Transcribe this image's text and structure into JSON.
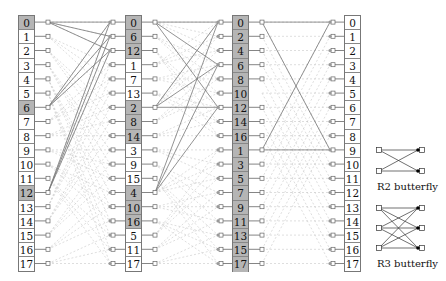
{
  "diagram": {
    "type": "mixed-radix FFT signal flow (N=18)",
    "columns": [
      {
        "id": "input",
        "values": [
          0,
          1,
          2,
          3,
          4,
          5,
          6,
          7,
          8,
          9,
          10,
          11,
          12,
          13,
          14,
          15,
          16,
          17
        ],
        "highlight_rows": [
          0,
          6,
          12
        ]
      },
      {
        "id": "stage1",
        "values": [
          0,
          6,
          12,
          1,
          7,
          13,
          2,
          8,
          14,
          3,
          9,
          15,
          4,
          10,
          16,
          5,
          11,
          17
        ],
        "highlight_rows": [
          0,
          1,
          2,
          6,
          7,
          8,
          12,
          13,
          14
        ]
      },
      {
        "id": "stage2",
        "values": [
          0,
          2,
          4,
          6,
          8,
          10,
          12,
          14,
          16,
          1,
          3,
          5,
          7,
          9,
          11,
          13,
          15,
          17
        ],
        "highlight_rows": [
          0,
          1,
          2,
          3,
          4,
          5,
          6,
          7,
          8,
          9,
          10,
          11,
          12,
          13,
          14,
          15,
          16,
          17
        ]
      },
      {
        "id": "output",
        "values": [
          0,
          1,
          2,
          3,
          4,
          5,
          6,
          7,
          8,
          9,
          10,
          11,
          12,
          13,
          14,
          15,
          16,
          17
        ],
        "highlight_rows": []
      }
    ],
    "stage_radix": [
      3,
      3,
      2
    ],
    "solid_groups": [
      {
        "from_rows": [
          0,
          6,
          12
        ],
        "to_rows": [
          0,
          1,
          2
        ]
      },
      {
        "from_rows": [
          0,
          6,
          12
        ],
        "to_rows": [
          0,
          3,
          6
        ]
      },
      {
        "from_rows": [
          0,
          9
        ],
        "to_rows": [
          0,
          9
        ]
      }
    ],
    "missing_stub_rows_stage2": [
      5
    ]
  },
  "legend": {
    "r2_label": "R2 butterfly",
    "r3_label": "R3 butterfly"
  },
  "colors": {
    "highlight_fill": "#b5b5b5",
    "solid_line": "#777777",
    "dashed_line": "#c8c8c8",
    "box_border": "#777777"
  }
}
